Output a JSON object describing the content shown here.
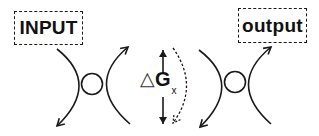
{
  "diagram": {
    "input_label": "INPUT",
    "output_label": "output",
    "delta": {
      "symbol": "△",
      "variable": "G",
      "subscript": "x"
    },
    "elements": {
      "left_junction": {
        "type": "x-shaped-crossing",
        "arrows": [
          "down-left",
          "up-right"
        ],
        "center_node": "circle"
      },
      "right_junction": {
        "type": "x-shaped-crossing",
        "arrows": [
          "down-left",
          "up-right"
        ],
        "center_node": "circle"
      },
      "center_arrows": [
        "up",
        "down"
      ],
      "dashed_arc_arrow": "curved-dashed-arrow-downward"
    },
    "colors": {
      "stroke": "#1a1a1a",
      "background": "#ffffff"
    }
  }
}
